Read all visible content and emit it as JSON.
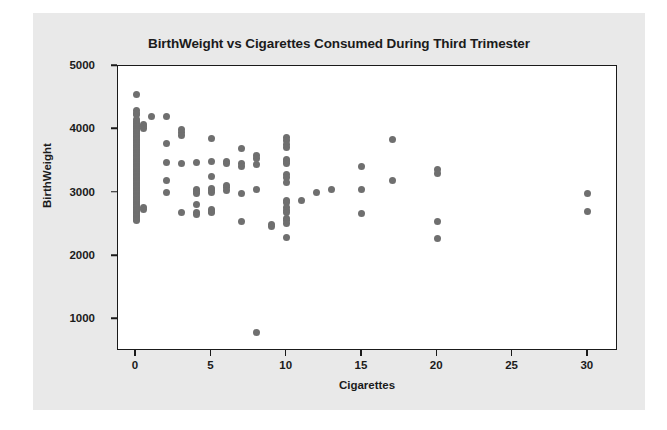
{
  "chart_data": {
    "type": "scatter",
    "title": "BirthWeight vs Cigarettes Consumed During Third Trimester",
    "xlabel": "Cigarettes",
    "ylabel": "BirthWeight",
    "xlim": [
      -1.2,
      32
    ],
    "ylim": [
      500,
      5000
    ],
    "grid": false,
    "legend": null,
    "marker_color": "#6f6f6f",
    "figure_background": "#e9e9e9",
    "plot_background": "#ffffff",
    "axis_color": "#1a1a1a",
    "xticks": [
      0,
      5,
      10,
      15,
      20,
      25,
      30
    ],
    "xtick_labels": [
      "0",
      "5",
      "10",
      "15",
      "20",
      "25",
      "30"
    ],
    "yticks": [
      1000,
      2000,
      3000,
      4000,
      5000
    ],
    "ytick_labels": [
      "1000",
      "2000",
      "3000",
      "4000",
      "5000"
    ],
    "points": [
      [
        0,
        4550
      ],
      [
        0,
        4300
      ],
      [
        0,
        4250
      ],
      [
        0,
        4230
      ],
      [
        0,
        4150
      ],
      [
        0,
        4120
      ],
      [
        0,
        4100
      ],
      [
        0,
        4080
      ],
      [
        0,
        4060
      ],
      [
        0,
        4040
      ],
      [
        0,
        4020
      ],
      [
        0,
        4000
      ],
      [
        0,
        3980
      ],
      [
        0,
        3960
      ],
      [
        0,
        3940
      ],
      [
        0,
        3920
      ],
      [
        0,
        3900
      ],
      [
        0,
        3880
      ],
      [
        0,
        3860
      ],
      [
        0,
        3840
      ],
      [
        0,
        3820
      ],
      [
        0,
        3800
      ],
      [
        0,
        3780
      ],
      [
        0,
        3760
      ],
      [
        0,
        3740
      ],
      [
        0,
        3720
      ],
      [
        0,
        3700
      ],
      [
        0,
        3680
      ],
      [
        0,
        3660
      ],
      [
        0,
        3640
      ],
      [
        0,
        3620
      ],
      [
        0,
        3600
      ],
      [
        0,
        3580
      ],
      [
        0,
        3560
      ],
      [
        0,
        3540
      ],
      [
        0,
        3520
      ],
      [
        0,
        3500
      ],
      [
        0,
        3480
      ],
      [
        0,
        3460
      ],
      [
        0,
        3440
      ],
      [
        0,
        3420
      ],
      [
        0,
        3400
      ],
      [
        0,
        3380
      ],
      [
        0,
        3360
      ],
      [
        0,
        3340
      ],
      [
        0,
        3320
      ],
      [
        0,
        3300
      ],
      [
        0,
        3280
      ],
      [
        0,
        3260
      ],
      [
        0,
        3240
      ],
      [
        0,
        3220
      ],
      [
        0,
        3200
      ],
      [
        0,
        3180
      ],
      [
        0,
        3160
      ],
      [
        0,
        3140
      ],
      [
        0,
        3120
      ],
      [
        0,
        3100
      ],
      [
        0,
        3080
      ],
      [
        0,
        3060
      ],
      [
        0,
        3040
      ],
      [
        0,
        3020
      ],
      [
        0,
        3000
      ],
      [
        0,
        2980
      ],
      [
        0,
        2960
      ],
      [
        0,
        2940
      ],
      [
        0,
        2920
      ],
      [
        0,
        2900
      ],
      [
        0,
        2880
      ],
      [
        0,
        2860
      ],
      [
        0,
        2840
      ],
      [
        0,
        2820
      ],
      [
        0,
        2800
      ],
      [
        0,
        2780
      ],
      [
        0,
        2760
      ],
      [
        0,
        2740
      ],
      [
        0,
        2720
      ],
      [
        0,
        2700
      ],
      [
        0,
        2680
      ],
      [
        0,
        2660
      ],
      [
        0,
        2640
      ],
      [
        0,
        2620
      ],
      [
        0,
        2600
      ],
      [
        0,
        2580
      ],
      [
        0,
        2560
      ],
      [
        0.5,
        4080
      ],
      [
        0.5,
        4050
      ],
      [
        0.5,
        4020
      ],
      [
        0.5,
        2760
      ],
      [
        0.5,
        2740
      ],
      [
        1,
        4200
      ],
      [
        2,
        4200
      ],
      [
        2,
        3770
      ],
      [
        2,
        3470
      ],
      [
        2,
        3200
      ],
      [
        2,
        3010
      ],
      [
        3,
        3990
      ],
      [
        3,
        3950
      ],
      [
        3,
        3900
      ],
      [
        3,
        3460
      ],
      [
        3,
        2690
      ],
      [
        4,
        3470
      ],
      [
        4,
        3050
      ],
      [
        4,
        3020
      ],
      [
        4,
        2990
      ],
      [
        4,
        2810
      ],
      [
        4,
        2680
      ],
      [
        4,
        2660
      ],
      [
        5,
        3860
      ],
      [
        5,
        3500
      ],
      [
        5,
        3260
      ],
      [
        5,
        3060
      ],
      [
        5,
        3030
      ],
      [
        5,
        3000
      ],
      [
        5,
        2740
      ],
      [
        5,
        2710
      ],
      [
        5,
        2690
      ],
      [
        6,
        3500
      ],
      [
        6,
        3460
      ],
      [
        6,
        3120
      ],
      [
        6,
        3080
      ],
      [
        6,
        3040
      ],
      [
        7,
        3700
      ],
      [
        7,
        3460
      ],
      [
        7,
        3420
      ],
      [
        7,
        2990
      ],
      [
        7,
        2540
      ],
      [
        8,
        3580
      ],
      [
        8,
        3540
      ],
      [
        8,
        3440
      ],
      [
        8,
        3050
      ],
      [
        8,
        800
      ],
      [
        9,
        2500
      ],
      [
        9,
        2470
      ],
      [
        10,
        3870
      ],
      [
        10,
        3830
      ],
      [
        10,
        3760
      ],
      [
        10,
        3720
      ],
      [
        10,
        3520
      ],
      [
        10,
        3490
      ],
      [
        10,
        3460
      ],
      [
        10,
        3280
      ],
      [
        10,
        3240
      ],
      [
        10,
        3160
      ],
      [
        10,
        2870
      ],
      [
        10,
        2840
      ],
      [
        10,
        2760
      ],
      [
        10,
        2720
      ],
      [
        10,
        2680
      ],
      [
        10,
        2600
      ],
      [
        10,
        2560
      ],
      [
        10,
        2520
      ],
      [
        10,
        2300
      ],
      [
        11,
        2880
      ],
      [
        12,
        3010
      ],
      [
        13,
        3050
      ],
      [
        15,
        3420
      ],
      [
        15,
        3050
      ],
      [
        15,
        2670
      ],
      [
        17,
        3840
      ],
      [
        17,
        3200
      ],
      [
        20,
        3360
      ],
      [
        20,
        3310
      ],
      [
        20,
        2550
      ],
      [
        20,
        2280
      ],
      [
        30,
        2980
      ],
      [
        30,
        2710
      ]
    ]
  }
}
